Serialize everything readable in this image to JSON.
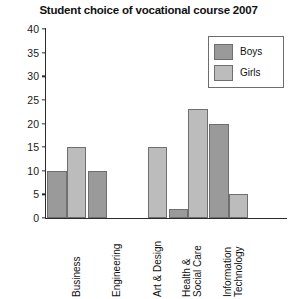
{
  "chart_data": {
    "type": "bar",
    "title": "Student choice of vocational course 2007",
    "xlabel": "",
    "ylabel": "",
    "ylim": [
      0,
      40
    ],
    "ytick_step": 5,
    "yticks": [
      0,
      5,
      10,
      15,
      20,
      25,
      30,
      35,
      40
    ],
    "grid": false,
    "legend_position": "top-right",
    "categories": [
      "Business",
      "Engineering",
      "Art & Design",
      "Health & Social Care",
      "Information Technology"
    ],
    "series": [
      {
        "name": "Boys",
        "color": "#9a9a9a",
        "values": [
          10,
          10,
          0,
          2,
          20
        ]
      },
      {
        "name": "Girls",
        "color": "#bcbcbc",
        "values": [
          15,
          0,
          15,
          23,
          5
        ]
      }
    ]
  },
  "legend": {
    "items": [
      {
        "label": "Boys"
      },
      {
        "label": "Girls"
      }
    ]
  }
}
